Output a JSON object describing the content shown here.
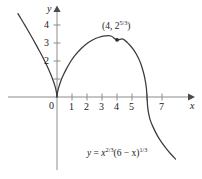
{
  "chart_data": {
    "type": "line",
    "title": "",
    "xlabel": "x",
    "ylabel": "y",
    "equation_plain": "y = x^(2/3)(6 - x)^(1/3)",
    "equation_parts": {
      "lhs": "y",
      "equals": "=",
      "base1": "x",
      "exp1_num": "2",
      "exp1_den": "3",
      "mid": "(6 − x)",
      "exp2_num": "1",
      "exp2_den": "3"
    },
    "xlim": [
      -2.6,
      7.9
    ],
    "ylim": [
      -4.6,
      4.7
    ],
    "x_ticks": [
      1,
      2,
      3,
      4,
      5,
      6,
      7
    ],
    "x_tick_labels": [
      "1",
      "2",
      "3",
      "4",
      "5",
      "",
      "7"
    ],
    "y_ticks": [
      2,
      3,
      4
    ],
    "y_tick_labels": [
      "2",
      "3",
      "4"
    ],
    "origin_label": "0",
    "grid": false,
    "legend": false,
    "axis_color": "#8c8c8c",
    "curve_color": "#3a3a3a",
    "background": "#ffffff",
    "annotations": [
      {
        "name": "maximum-point",
        "label_plain": "(4, 2^(5/3))",
        "label_prefix": "(4, 2",
        "label_exp_num": "5",
        "label_exp_den": "3",
        "label_suffix": ")",
        "x": 4,
        "y": 3.1748,
        "marker": "dot"
      }
    ],
    "x_intercepts": [
      0,
      6
    ],
    "series": [
      {
        "name": "y = x^(2/3)(6 - x)^(1/3)",
        "points_x": [
          -2.6,
          -2.4,
          -2.2,
          -2.0,
          -1.8,
          -1.6,
          -1.4,
          -1.2,
          -1.0,
          -0.8,
          -0.6,
          -0.4,
          -0.25,
          -0.12,
          -0.04,
          0,
          0.04,
          0.12,
          0.25,
          0.4,
          0.6,
          0.9,
          1.2,
          1.6,
          2.0,
          2.4,
          2.8,
          3.2,
          3.6,
          4.0,
          4.4,
          4.8,
          5.1,
          5.4,
          5.6,
          5.8,
          5.9,
          5.96,
          6.0,
          6.04,
          6.1,
          6.2,
          6.4,
          6.7,
          7.0,
          7.3,
          7.6,
          7.9
        ],
        "points_y": [
          4.63,
          4.35,
          4.07,
          3.79,
          3.5,
          3.21,
          2.91,
          2.6,
          2.29,
          1.96,
          1.61,
          1.22,
          0.9,
          0.56,
          0.27,
          0,
          0.27,
          0.55,
          0.88,
          1.18,
          1.52,
          1.96,
          2.31,
          2.68,
          2.97,
          3.18,
          3.32,
          3.39,
          3.39,
          3.17,
          3.22,
          2.93,
          2.63,
          2.21,
          1.82,
          1.25,
          0.83,
          0.48,
          0,
          -0.51,
          -0.88,
          -1.24,
          -1.66,
          -2.16,
          -2.55,
          -2.88,
          -3.18,
          -3.45
        ]
      }
    ]
  },
  "labels": {
    "y_axis_name": "y",
    "x_axis_name": "x"
  }
}
